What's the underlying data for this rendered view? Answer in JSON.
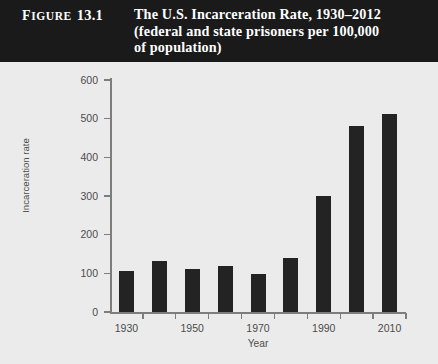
{
  "figure": {
    "label_word": "IGURE",
    "label_cap": "F",
    "label_number": "13.1",
    "title_line1": "The U.S. Incarceration Rate, 1930–2012",
    "title_line2": "(federal and state prisoners per 100,000",
    "title_line3": "of population)"
  },
  "colors": {
    "header_background": "#1a1a1a",
    "header_text": "#ffffff",
    "panel_background": "#ebebeb",
    "bar_fill": "#232323",
    "axis_line": "#7d7d7d",
    "tick_text": "#4b4b4b"
  },
  "chart_data": {
    "type": "bar",
    "title": "The U.S. Incarceration Rate, 1930–2012 (federal and state prisoners per 100,000 of population)",
    "xlabel": "Year",
    "ylabel": "Incarceration rate",
    "categories": [
      "1930",
      "1940",
      "1950",
      "1960",
      "1970",
      "1980",
      "1990",
      "2000",
      "2010"
    ],
    "values": [
      105,
      131,
      111,
      119,
      97,
      140,
      300,
      480,
      512
    ],
    "xtick_labels": [
      "1930",
      "1950",
      "1970",
      "1990",
      "2010"
    ],
    "ytick_labels": [
      "0",
      "100",
      "200",
      "300",
      "400",
      "500",
      "600"
    ],
    "ytick_values": [
      0,
      100,
      200,
      300,
      400,
      500,
      600
    ],
    "ylim": [
      0,
      600
    ],
    "grid": false,
    "legend": false,
    "legend_position": "none"
  }
}
